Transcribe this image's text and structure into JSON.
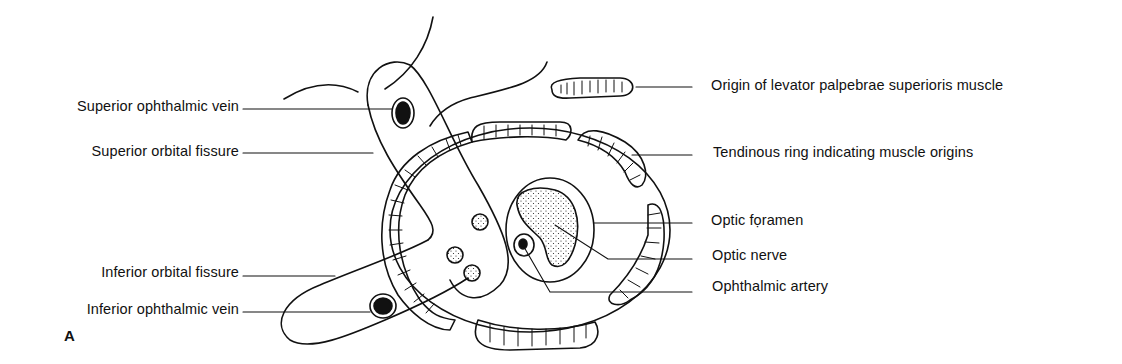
{
  "figure": {
    "panel_letter": "A",
    "labels_left": [
      {
        "id": "superior-ophthalmic-vein",
        "text": "Superior ophthalmic vein"
      },
      {
        "id": "superior-orbital-fissure",
        "text": "Superior orbital fissure"
      },
      {
        "id": "inferior-orbital-fissure",
        "text": "Inferior orbital fissure"
      },
      {
        "id": "inferior-ophthalmic-vein",
        "text": "Inferior ophthalmic vein"
      }
    ],
    "labels_right": [
      {
        "id": "levator-origin",
        "text": "Origin of levator palpebrae superioris muscle"
      },
      {
        "id": "tendinous-ring",
        "text": "Tendinous ring indicating muscle origins"
      },
      {
        "id": "optic-foramen",
        "text": "Optic fọramen"
      },
      {
        "id": "optic-nerve",
        "text": "Optic nerve"
      },
      {
        "id": "ophthalmic-artery",
        "text": "Ophthalmic artery"
      }
    ],
    "colors": {
      "ink": "#111111",
      "background": "#ffffff"
    }
  }
}
